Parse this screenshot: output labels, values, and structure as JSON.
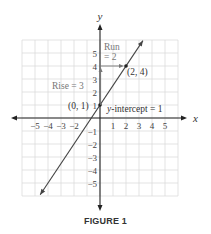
{
  "chart_data": {
    "type": "line",
    "title": "",
    "xlabel": "x",
    "ylabel": "y",
    "xlim": [
      -6,
      6
    ],
    "ylim": [
      -6,
      6
    ],
    "grid": true,
    "x_ticks": [
      "−5",
      "−4",
      "−3",
      "−2",
      "1",
      "2",
      "3",
      "4",
      "5"
    ],
    "y_ticks": [
      "5",
      "4",
      "3",
      "2",
      "1",
      "−1",
      "−2",
      "−3",
      "−4",
      "−5"
    ],
    "series": [
      {
        "name": "line",
        "equation": "y = 1.5x + 1",
        "slope": 1.5,
        "intercept": 1
      }
    ],
    "points": [
      {
        "label": "(0, 1)",
        "x": 0,
        "y": 1
      },
      {
        "label": "(2, 4)",
        "x": 2,
        "y": 4
      }
    ],
    "annotations": [
      {
        "text": "Run",
        "text2": "= 2"
      },
      {
        "text": "Rise = 3"
      },
      {
        "text": "y-intercept = 1"
      }
    ]
  },
  "labels": {
    "x_axis": "x",
    "y_axis": "y",
    "run_line1": "Run",
    "run_line2": "= 2",
    "rise": "Rise = 3",
    "point_a": "(0, 1)",
    "point_b": "(2, 4)",
    "intercept": "y-intercept = 1",
    "caption": "FIGURE 1"
  },
  "colors": {
    "grid": "#dcdcdc",
    "axis": "#222222",
    "line": "#444444",
    "annotation": "#777777",
    "text": "#333333"
  }
}
